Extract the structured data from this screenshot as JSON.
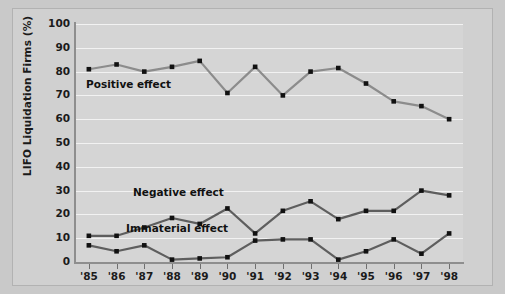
{
  "chart_data": {
    "type": "line",
    "title": "",
    "xlabel": "",
    "ylabel": "LIFO Liquidation Firms (%)",
    "categories": [
      "'85",
      "'86",
      "'87",
      "'88",
      "'89",
      "'90",
      "'91",
      "'92",
      "'93",
      "'94",
      "'95",
      "'96",
      "'97",
      "'98"
    ],
    "ylim": [
      0,
      100
    ],
    "ytick_labels": [
      "0",
      "10",
      "20",
      "30",
      "40",
      "50",
      "60",
      "70",
      "80",
      "90",
      "100"
    ],
    "yticks": [
      0,
      10,
      20,
      30,
      40,
      50,
      60,
      70,
      80,
      90,
      100
    ],
    "grid": true,
    "legend_position": "inline-annotations",
    "series": [
      {
        "name": "Positive effect",
        "color": "#8c8c8c",
        "marker_color": "#111111",
        "values": [
          81,
          83,
          80,
          82,
          84.5,
          71,
          82,
          70,
          80,
          81.5,
          75,
          67.5,
          65.5,
          60
        ]
      },
      {
        "name": "Negative effect",
        "color": "#5e5e5e",
        "marker_color": "#111111",
        "values": [
          11,
          11,
          14.5,
          18.5,
          16,
          22.5,
          12,
          21.5,
          25.5,
          18,
          21.5,
          21.5,
          30,
          28
        ]
      },
      {
        "name": "Immaterial effect",
        "color": "#5e5e5e",
        "marker_color": "#111111",
        "values": [
          7,
          4.5,
          7,
          1,
          1.5,
          2,
          9,
          9.5,
          9.5,
          1,
          4.5,
          9.5,
          3.5,
          12
        ]
      }
    ],
    "annotations": [
      {
        "text": "Positive effect",
        "x": 86,
        "y": 78
      },
      {
        "text": "Negative effect",
        "x": 133,
        "y": 186
      },
      {
        "text": "Immaterial effect",
        "x": 126,
        "y": 222
      }
    ]
  },
  "figure": {
    "background_color": "#c9c9c9",
    "plot_background_color": "#d5d5d5",
    "gridline_color": "#f2f2f2",
    "axis_color": "#8e8e8e"
  }
}
